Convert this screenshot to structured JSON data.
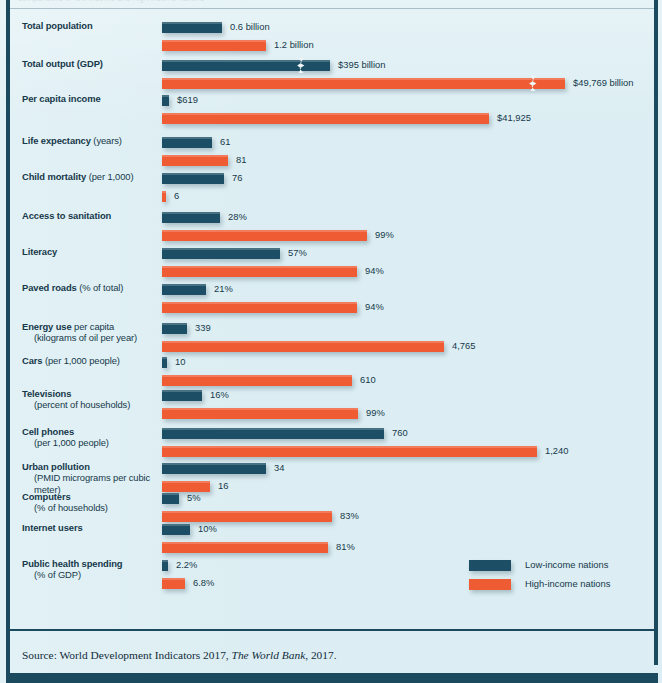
{
  "figure": {
    "background_color": "#dceef3",
    "frame_color": "#1b4a5e",
    "low_color": "#1c4e66",
    "high_color": "#ef5b33",
    "cut_off_header_text": "comparisons of low-income and high-income nations"
  },
  "legend": {
    "position": "bottom-right",
    "items": [
      {
        "label": "Low-income nations",
        "color": "#1c4e66",
        "swatch": "low"
      },
      {
        "label": "High-income nations",
        "color": "#ef5b33",
        "swatch": "high"
      }
    ]
  },
  "source": {
    "prefix": "Source: World Development Indicators 2017,",
    "italic": "The World Bank",
    "suffix": ", 2017."
  },
  "chart_data": {
    "type": "bar",
    "orientation": "horizontal",
    "title": "",
    "subtitle": "",
    "xlabel": "",
    "ylabel": "",
    "grid": false,
    "legend_position": "bottom-right",
    "series": [
      {
        "name": "Low-income nations",
        "color": "#1c4e66"
      },
      {
        "name": "High-income nations",
        "color": "#ef5b33"
      }
    ],
    "note": "Each category uses its own scale; bars are drawn to the pixel lengths in the original figure. Axis breaks (zigzag) appear on both Total output (GDP) bars.",
    "categories": [
      {
        "label_bold": "Total population",
        "label_rest": "",
        "label_sub": "",
        "low_value": "0.6 billion",
        "high_value": "1.2 billion",
        "low_number": 0.6,
        "high_number": 1.2,
        "unit": "billion people",
        "low_px": 60,
        "high_px": 104,
        "low_break": false,
        "high_break": false
      },
      {
        "label_bold": "Total output (GDP)",
        "label_rest": "",
        "label_sub": "",
        "low_value": "$395 billion",
        "high_value": "$49,769 billion",
        "low_number": 395,
        "high_number": 49769,
        "unit": "billion US dollars",
        "low_px": 168,
        "high_px": 403,
        "low_break": true,
        "high_break": true,
        "low_break_px": 139,
        "high_break_px": 371
      },
      {
        "label_bold": "Per capita income",
        "label_rest": "",
        "label_sub": "",
        "low_value": "$619",
        "high_value": "$41,925",
        "low_number": 619,
        "high_number": 41925,
        "unit": "US dollars",
        "low_px": 7,
        "high_px": 327,
        "low_break": false,
        "high_break": false
      },
      {
        "label_bold": "Life expectancy",
        "label_rest": " (years)",
        "label_sub": "",
        "low_value": "61",
        "high_value": "81",
        "low_number": 61,
        "high_number": 81,
        "unit": "years",
        "low_px": 50,
        "high_px": 66,
        "low_break": false,
        "high_break": false
      },
      {
        "label_bold": "Child mortality",
        "label_rest": " (per 1,000)",
        "label_sub": "",
        "low_value": "76",
        "high_value": "6",
        "low_number": 76,
        "high_number": 6,
        "unit": "deaths per 1,000",
        "low_px": 62,
        "high_px": 4,
        "low_break": false,
        "high_break": false
      },
      {
        "label_bold": "Access to sanitation",
        "label_rest": "",
        "label_sub": "",
        "low_value": "28%",
        "high_value": "99%",
        "low_number": 28,
        "high_number": 99,
        "unit": "percent",
        "low_px": 58,
        "high_px": 205,
        "low_break": false,
        "high_break": false
      },
      {
        "label_bold": "Literacy",
        "label_rest": "",
        "label_sub": "",
        "low_value": "57%",
        "high_value": "94%",
        "low_number": 57,
        "high_number": 94,
        "unit": "percent",
        "low_px": 118,
        "high_px": 195,
        "low_break": false,
        "high_break": false
      },
      {
        "label_bold": "Paved roads",
        "label_rest": " (% of total)",
        "label_sub": "",
        "low_value": "21%",
        "high_value": "94%",
        "low_number": 21,
        "high_number": 94,
        "unit": "percent",
        "low_px": 44,
        "high_px": 195,
        "low_break": false,
        "high_break": false
      },
      {
        "label_bold": "Energy use",
        "label_rest": " per capita",
        "label_sub": "(kilograms of oil per year)",
        "low_value": "339",
        "high_value": "4,765",
        "low_number": 339,
        "high_number": 4765,
        "unit": "kilograms of oil per year",
        "low_px": 25,
        "high_px": 282,
        "low_break": false,
        "high_break": false
      },
      {
        "label_bold": "Cars",
        "label_rest": " (per 1,000 people)",
        "label_sub": "",
        "low_value": "10",
        "high_value": "610",
        "low_number": 10,
        "high_number": 610,
        "unit": "per 1,000 people",
        "low_px": 5,
        "high_px": 190,
        "low_break": false,
        "high_break": false
      },
      {
        "label_bold": "Televisions",
        "label_rest": "",
        "label_sub": "(percent of households)",
        "low_value": "16%",
        "high_value": "99%",
        "low_number": 16,
        "high_number": 99,
        "unit": "percent of households",
        "low_px": 40,
        "high_px": 196,
        "low_break": false,
        "high_break": false
      },
      {
        "label_bold": "Cell phones",
        "label_rest": "",
        "label_sub": "(per 1,000 people)",
        "low_value": "760",
        "high_value": "1,240",
        "low_number": 760,
        "high_number": 1240,
        "unit": "per 1,000 people",
        "low_px": 222,
        "high_px": 375,
        "low_break": false,
        "high_break": false
      },
      {
        "label_bold": "Urban pollution",
        "label_rest": "",
        "label_sub": "(PMID micrograms per cubic meter)",
        "low_value": "34",
        "high_value": "16",
        "low_number": 34,
        "high_number": 16,
        "unit": "micrograms per cubic meter",
        "low_px": 104,
        "high_px": 48,
        "low_break": false,
        "high_break": false
      },
      {
        "label_bold": "Computers",
        "label_rest": "",
        "label_sub": "(% of households)",
        "low_value": "5%",
        "high_value": "83%",
        "low_number": 5,
        "high_number": 83,
        "unit": "percent of households",
        "low_px": 17,
        "high_px": 170,
        "low_break": false,
        "high_break": false
      },
      {
        "label_bold": "Internet users",
        "label_rest": "",
        "label_sub": "",
        "low_value": "10%",
        "high_value": "81%",
        "low_number": 10,
        "high_number": 81,
        "unit": "percent",
        "low_px": 28,
        "high_px": 166,
        "low_break": false,
        "high_break": false
      },
      {
        "label_bold": "Public health spending",
        "label_rest": "",
        "label_sub": "(% of GDP)",
        "low_value": "2.2%",
        "high_value": "6.8%",
        "low_number": 2.2,
        "high_number": 6.8,
        "unit": "percent of GDP",
        "low_px": 6,
        "high_px": 23,
        "low_break": false,
        "high_break": false
      }
    ]
  }
}
